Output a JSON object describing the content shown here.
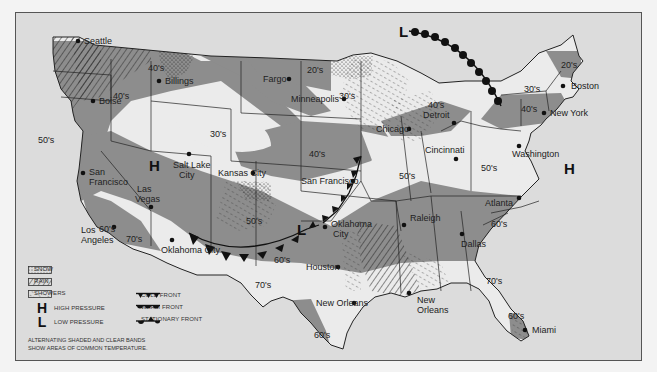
{
  "map": {
    "title": "U.S. Weather Map",
    "colors": {
      "background": "#dcdcdc",
      "land_clear": "#e9e9e9",
      "band_shaded": "#8d8d8d",
      "border": "#222222",
      "frame": "#555555"
    },
    "cities": [
      {
        "name": "Seattle",
        "x": 78,
        "y": 40
      },
      {
        "name": "Billings",
        "x": 158,
        "y": 80
      },
      {
        "name": "Boise",
        "x": 92,
        "y": 100
      },
      {
        "name": "Fargo",
        "x": 288,
        "y": 78
      },
      {
        "name": "Minneapolis",
        "x": 343,
        "y": 98
      },
      {
        "name": "Detroit",
        "x": 453,
        "y": 122
      },
      {
        "name": "Boston",
        "x": 562,
        "y": 85
      },
      {
        "name": "New York",
        "x": 543,
        "y": 112
      },
      {
        "name": "Chicago",
        "x": 408,
        "y": 128
      },
      {
        "name": "Cincinnati",
        "x": 455,
        "y": 158
      },
      {
        "name": "Washington",
        "x": 518,
        "y": 145
      },
      {
        "name": "Salt Lake City",
        "x": 182,
        "y": 142
      },
      {
        "name": "Denver",
        "x": 252,
        "y": 180
      },
      {
        "name": "Kansas City",
        "x": 348,
        "y": 180
      },
      {
        "name": "San Francisco",
        "x": 82,
        "y": 173
      },
      {
        "name": "Las Vegas",
        "x": 148,
        "y": 203
      },
      {
        "name": "Los Angeles",
        "x": 101,
        "y": 227
      },
      {
        "name": "Phoenix",
        "x": 160,
        "y": 237
      },
      {
        "name": "Oklahoma City",
        "x": 323,
        "y": 226
      },
      {
        "name": "Memphis",
        "x": 402,
        "y": 224
      },
      {
        "name": "Raleigh",
        "x": 518,
        "y": 198
      },
      {
        "name": "Atlanta",
        "x": 461,
        "y": 235
      },
      {
        "name": "Dallas",
        "x": 336,
        "y": 266
      },
      {
        "name": "Houston",
        "x": 353,
        "y": 302
      },
      {
        "name": "New Orleans",
        "x": 408,
        "y": 292
      },
      {
        "name": "Miami",
        "x": 527,
        "y": 329
      }
    ],
    "temperature_labels": [
      {
        "text": "40's",
        "x": 145,
        "y": 67
      },
      {
        "text": "40's",
        "x": 112,
        "y": 98
      },
      {
        "text": "20's",
        "x": 314,
        "y": 68
      },
      {
        "text": "30's",
        "x": 343,
        "y": 95
      },
      {
        "text": "20's",
        "x": 567,
        "y": 62
      },
      {
        "text": "30's",
        "x": 523,
        "y": 88
      },
      {
        "text": "40's",
        "x": 522,
        "y": 108
      },
      {
        "text": "40's",
        "x": 428,
        "y": 104
      },
      {
        "text": "30's",
        "x": 224,
        "y": 134
      },
      {
        "text": "50's",
        "x": 37,
        "y": 140
      },
      {
        "text": "40's",
        "x": 328,
        "y": 154
      },
      {
        "text": "50's",
        "x": 405,
        "y": 176
      },
      {
        "text": "50's",
        "x": 495,
        "y": 168
      },
      {
        "text": "50's",
        "x": 238,
        "y": 221
      },
      {
        "text": "60's",
        "x": 90,
        "y": 236
      },
      {
        "text": "70's",
        "x": 116,
        "y": 254
      },
      {
        "text": "60's",
        "x": 273,
        "y": 250
      },
      {
        "text": "60's",
        "x": 534,
        "y": 227
      },
      {
        "text": "70's",
        "x": 239,
        "y": 286
      },
      {
        "text": "70's",
        "x": 512,
        "y": 283
      },
      {
        "text": "60's",
        "x": 318,
        "y": 336
      },
      {
        "text": "60's",
        "x": 513,
        "y": 318
      }
    ],
    "pressure_centers": [
      {
        "symbol": "H",
        "x": 148,
        "y": 164,
        "meaning": "high"
      },
      {
        "symbol": "H",
        "x": 563,
        "y": 167,
        "meaning": "high"
      },
      {
        "symbol": "L",
        "x": 404,
        "y": 30,
        "meaning": "low"
      },
      {
        "symbol": "L",
        "x": 302,
        "y": 228,
        "meaning": "low"
      }
    ]
  },
  "legend": {
    "items": [
      {
        "key": "snow",
        "label": "SNOW"
      },
      {
        "key": "rain",
        "label": "RAIN"
      },
      {
        "key": "showers",
        "label": "SHOWERS"
      },
      {
        "key": "high",
        "symbol": "H",
        "label": "HIGH PRESSURE"
      },
      {
        "key": "low",
        "symbol": "L",
        "label": "LOW PRESSURE"
      },
      {
        "key": "cold_front",
        "label": "COLD FRONT"
      },
      {
        "key": "warm_front",
        "label": "WARM FRONT"
      },
      {
        "key": "stationary_front",
        "label": "STATIONARY FRONT"
      }
    ],
    "note_line1": "ALTERNATING SHADED AND CLEAR BANDS",
    "note_line2": "SHOW AREAS OF COMMON TEMPERATURE."
  }
}
